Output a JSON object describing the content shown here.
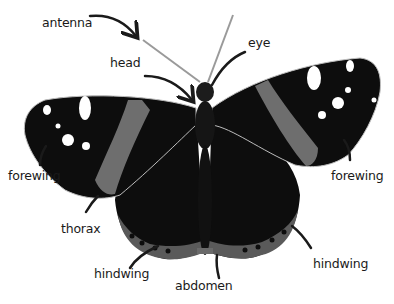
{
  "diagram": {
    "colors": {
      "background": "#ffffff",
      "wing_dark": "#0d0d0d",
      "wing_band": "#6e6e6e",
      "hindwing_border": "#5a5a5a",
      "spots": "#ffffff",
      "leader_line": "#1a1a1a",
      "label_text": "#1a1a1a"
    },
    "labels": [
      {
        "id": "antenna",
        "text": "antenna",
        "x": 42,
        "y": 22
      },
      {
        "id": "head",
        "text": "head",
        "x": 110,
        "y": 62
      },
      {
        "id": "eye",
        "text": "eye",
        "x": 248,
        "y": 42
      },
      {
        "id": "forewing-left",
        "text": "forewing",
        "x": 8,
        "y": 175
      },
      {
        "id": "forewing-right",
        "text": "forewing",
        "x": 331,
        "y": 175
      },
      {
        "id": "thorax",
        "text": "thorax",
        "x": 61,
        "y": 228
      },
      {
        "id": "hindwing-left",
        "text": "hindwing",
        "x": 94,
        "y": 273
      },
      {
        "id": "abdomen",
        "text": "abdomen",
        "x": 175,
        "y": 277
      },
      {
        "id": "hindwing-right",
        "text": "hindwing",
        "x": 313,
        "y": 256
      }
    ]
  }
}
